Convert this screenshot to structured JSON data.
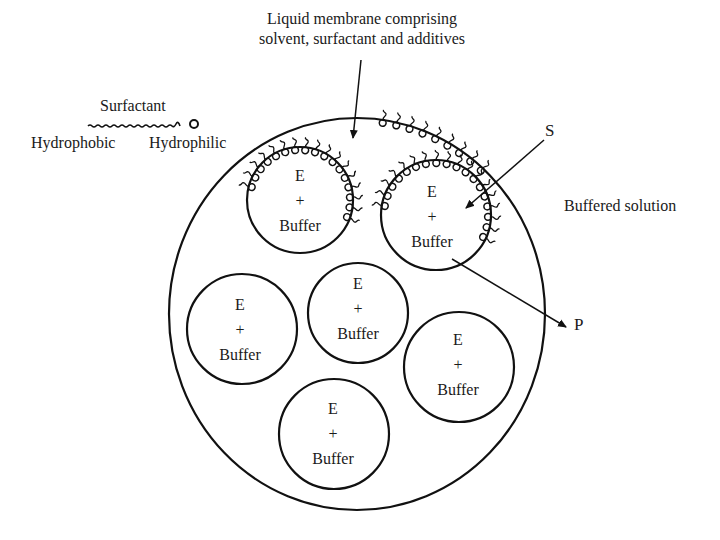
{
  "diagram": {
    "type": "liquid-membrane-encapsulated-enzyme",
    "membrane_label": {
      "line1": "Liquid membrane comprising",
      "line2": "solvent, surfactant and additives"
    },
    "legend": {
      "title": "Surfactant",
      "hydrophobic": "Hydrophobic",
      "hydrophilic": "Hydrophilic"
    },
    "substrate_label": "S",
    "product_label": "P",
    "outer_label": "Buffered solution",
    "droplets": [
      {
        "id": "droplet-1",
        "top": "E",
        "mid": "+",
        "bottom": "Buffer",
        "cx": 300,
        "cy": 200,
        "r": 53,
        "surfactant": true
      },
      {
        "id": "droplet-2",
        "top": "E",
        "mid": "+",
        "bottom": "Buffer",
        "cx": 436,
        "cy": 215,
        "r": 55,
        "surfactant": true
      },
      {
        "id": "droplet-3",
        "top": "E",
        "mid": "+",
        "bottom": "Buffer",
        "cx": 242,
        "cy": 329,
        "r": 55,
        "surfactant": false
      },
      {
        "id": "droplet-4",
        "top": "E",
        "mid": "+",
        "bottom": "Buffer",
        "cx": 358,
        "cy": 313,
        "r": 50,
        "surfactant": false
      },
      {
        "id": "droplet-5",
        "top": "E",
        "mid": "+",
        "bottom": "Buffer",
        "cx": 459,
        "cy": 367,
        "r": 55,
        "surfactant": false
      },
      {
        "id": "droplet-6",
        "top": "E",
        "mid": "+",
        "bottom": "Buffer",
        "cx": 334,
        "cy": 434,
        "r": 55,
        "surfactant": false
      }
    ],
    "colors": {
      "line": "#111111",
      "text": "#1a1a1a",
      "background": "#ffffff"
    }
  }
}
